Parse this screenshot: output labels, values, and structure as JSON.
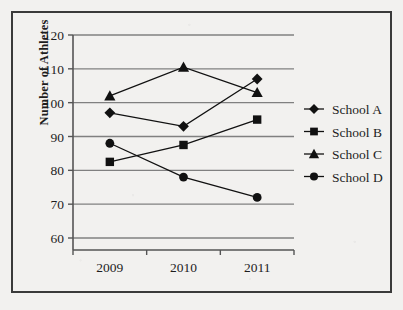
{
  "chart_data": {
    "type": "line",
    "title": "",
    "xlabel": "",
    "ylabel": "Number of Athletes",
    "categories": [
      "2009",
      "2010",
      "2011"
    ],
    "ylim": [
      60,
      120
    ],
    "yticks": [
      60,
      70,
      80,
      90,
      100,
      110,
      120
    ],
    "ytick_labels": [
      "60",
      "70",
      "80",
      "90",
      "100",
      "110",
      "120"
    ],
    "grid": "horizontal",
    "legend_position": "right",
    "marker_color": "#111111",
    "line_color": "#111111",
    "gridline_color": "#808080",
    "axis_color": "#555555",
    "background_color": "#f2f1ef",
    "series": [
      {
        "name": "School A",
        "marker": "diamond",
        "values": [
          97,
          93,
          107
        ]
      },
      {
        "name": "School B",
        "marker": "square",
        "values": [
          82.5,
          87.5,
          95
        ]
      },
      {
        "name": "School C",
        "marker": "triangle",
        "values": [
          102,
          110.5,
          103
        ]
      },
      {
        "name": "School D",
        "marker": "circle",
        "values": [
          88,
          78,
          72
        ]
      }
    ]
  },
  "legend": {
    "items": [
      {
        "label": "School A",
        "marker": "diamond"
      },
      {
        "label": "School B",
        "marker": "square"
      },
      {
        "label": "School C",
        "marker": "triangle"
      },
      {
        "label": "School D",
        "marker": "circle"
      }
    ]
  },
  "axis": {
    "y_title": "Number of Athletes"
  }
}
